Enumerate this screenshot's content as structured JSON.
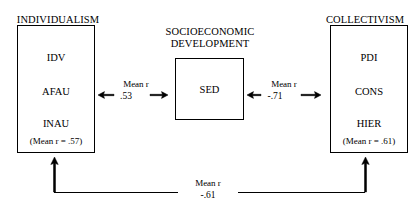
{
  "diagram": {
    "title_left": "INDIVIDUALISM",
    "title_center_line1": "SOCIOECONOMIC",
    "title_center_line2": "DEVELOPMENT",
    "title_right": "COLLECTIVISM",
    "left_box": {
      "items": [
        "IDV",
        "AFAU",
        "INAU"
      ],
      "mean": "(Mean r = .57)"
    },
    "center_box": {
      "items": [
        "SED"
      ]
    },
    "right_box": {
      "items": [
        "PDI",
        "CONS",
        "HIER"
      ],
      "mean": "(Mean r = .61)"
    },
    "relations": {
      "left_center": {
        "label": "Mean r",
        "value": ".53"
      },
      "center_right": {
        "label": "Mean r",
        "value": "-.71"
      },
      "left_right": {
        "label": "Mean r",
        "value": "-.61"
      }
    },
    "colors": {
      "stroke": "#000000",
      "background": "#ffffff"
    }
  }
}
